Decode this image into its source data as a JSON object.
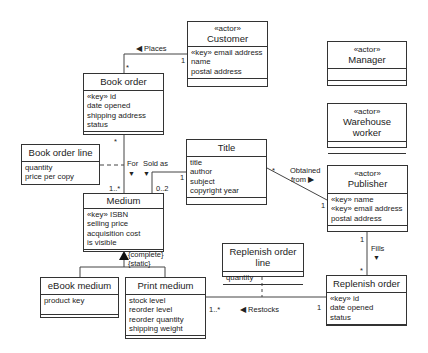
{
  "diagram": {
    "type": "UML class diagram",
    "classes": {
      "customer": {
        "stereotype": "«actor»",
        "name": "Customer",
        "attributes": [
          "«key» email address",
          "name",
          "postal address"
        ]
      },
      "manager": {
        "stereotype": "«actor»",
        "name": "Manager",
        "attributes": []
      },
      "warehouse_worker": {
        "stereotype": "«actor»",
        "name": "Warehouse worker",
        "attributes": []
      },
      "book_order": {
        "name": "Book order",
        "attributes": [
          "«key» id",
          "date opened",
          "shipping address",
          "status"
        ]
      },
      "book_order_line": {
        "name": "Book order line",
        "attributes": [
          "quantity",
          "price per copy"
        ]
      },
      "title": {
        "name": "Title",
        "attributes": [
          "title",
          "author",
          "subject",
          "copyright year"
        ]
      },
      "publisher": {
        "stereotype": "«actor»",
        "name": "Publisher",
        "attributes": [
          "«key» name",
          "«key» email address",
          "postal address"
        ]
      },
      "medium": {
        "name": "Medium",
        "attributes": [
          "«key» ISBN",
          "selling price",
          "acquisition cost",
          "is visible"
        ]
      },
      "ebook_medium": {
        "name": "eBook medium",
        "attributes": [
          "product key"
        ]
      },
      "print_medium": {
        "name": "Print medium",
        "attributes": [
          "stock level",
          "reorder level",
          "reorder quantity",
          "shipping weight"
        ]
      },
      "replenish_order_line": {
        "name": "Replenish order line",
        "attributes": [
          "quantity"
        ]
      },
      "replenish_order": {
        "name": "Replenish order",
        "attributes": [
          "«key» id",
          "date opened",
          "status"
        ]
      }
    },
    "associations": {
      "places": {
        "label": "◀ Places",
        "mult_customer": "1",
        "mult_order": "*"
      },
      "for": {
        "label": "For",
        "arrow": "▼",
        "mult_order": "*",
        "mult_medium": "1..*"
      },
      "sold_as": {
        "label": "Sold as",
        "arrow": "▼",
        "mult_title": "1",
        "mult_medium": "0..2"
      },
      "obtained_from": {
        "label1": "Obtained",
        "label2": "from ▶",
        "mult_title": "*",
        "mult_publisher": "1"
      },
      "fills": {
        "label": "Fills",
        "arrow": "▼",
        "mult_publisher": "1",
        "mult_replenish": "*"
      },
      "restocks": {
        "label": "◀ Restocks",
        "mult_print": "1..*",
        "mult_replenish": "1"
      },
      "generalization": {
        "constraint1": "{complete}",
        "constraint2": "{static}"
      }
    }
  }
}
